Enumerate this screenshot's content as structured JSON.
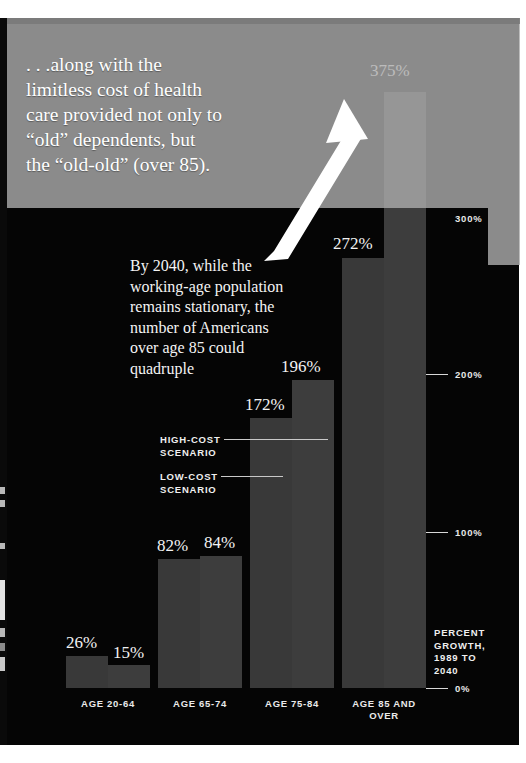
{
  "caption": {
    "text": ". . .along with the\nlimitless cost of health\ncare provided not only to\n“old” dependents, but\nthe “old-old” (over 85)."
  },
  "annotation": {
    "text": "By 2040, while the\nworking-age population\nremains stationary, the\nnumber of Americans\nover age 85 could\nquadruple"
  },
  "legend": {
    "high": "HIGH-COST\nSCENARIO",
    "low": "LOW-COST\nSCENARIO"
  },
  "axis": {
    "caption": "PERCENT\nGROWTH,\n1989 TO\n2040",
    "ticks": [
      "300%",
      "200%",
      "100%",
      "0%"
    ]
  },
  "colors": {
    "plate": "#050505",
    "bar": "#3b3b3b",
    "overlay": "#adadad",
    "text": "#f2f2f2"
  },
  "chart_data": {
    "type": "bar",
    "title": ". . .along with the limitless cost of health care provided not only to “old” dependents, but the “old-old” (over 85).",
    "xlabel": "",
    "ylabel": "PERCENT GROWTH, 1989 TO 2040",
    "ylim": [
      0,
      400
    ],
    "yticks": [
      0,
      100,
      200,
      300
    ],
    "ytick_labels": [
      "0%",
      "100%",
      "200%",
      "300%"
    ],
    "grid": false,
    "legend_position": "inside-left",
    "categories": [
      "AGE 20-64",
      "AGE 65-74",
      "AGE 75-84",
      "AGE 85 AND OVER"
    ],
    "series": [
      {
        "name": "LOW-COST SCENARIO",
        "values": [
          26,
          82,
          172,
          272
        ],
        "labels": [
          "26%",
          "82%",
          "172%",
          "272%"
        ]
      },
      {
        "name": "HIGH-COST SCENARIO",
        "values": [
          15,
          84,
          196,
          375
        ],
        "labels": [
          "15%",
          "84%",
          "196%",
          "375%"
        ]
      }
    ],
    "annotations": [
      "By 2040, while the working-age population remains stationary, the number of Americans over age 85 could quadruple"
    ]
  },
  "bars": [
    {
      "name": "age-20-64-low",
      "label": "26%",
      "x": 66,
      "y": 656,
      "w": 42,
      "h": 32,
      "cls": "lo"
    },
    {
      "name": "age-20-64-high",
      "label": "15%",
      "x": 108,
      "y": 665,
      "w": 42,
      "h": 23,
      "cls": "hi"
    },
    {
      "name": "age-65-74-low",
      "label": "82%",
      "x": 158,
      "y": 559,
      "w": 42,
      "h": 129,
      "cls": "lo"
    },
    {
      "name": "age-65-74-high",
      "label": "84%",
      "x": 200,
      "y": 556,
      "w": 42,
      "h": 132,
      "cls": "hi"
    },
    {
      "name": "age-75-84-low",
      "label": "172%",
      "x": 250,
      "y": 418,
      "w": 42,
      "h": 270,
      "cls": "lo"
    },
    {
      "name": "age-75-84-high",
      "label": "196%",
      "x": 292,
      "y": 380,
      "w": 42,
      "h": 308,
      "cls": "hi"
    },
    {
      "name": "age-85-over-low",
      "label": "272%",
      "x": 342,
      "y": 258,
      "w": 42,
      "h": 430,
      "cls": "lo"
    },
    {
      "name": "age-85-over-high",
      "label": "375%",
      "x": 384,
      "y": 92,
      "w": 42,
      "h": 596,
      "cls": "hi"
    }
  ],
  "value_labels": [
    {
      "name": "value-26",
      "text": "26%",
      "x": 66,
      "y": 634
    },
    {
      "name": "value-15",
      "text": "15%",
      "x": 113,
      "y": 644
    },
    {
      "name": "value-82",
      "text": "82%",
      "x": 157,
      "y": 537
    },
    {
      "name": "value-84",
      "text": "84%",
      "x": 204,
      "y": 534
    },
    {
      "name": "value-172",
      "text": "172%",
      "x": 245,
      "y": 396
    },
    {
      "name": "value-196",
      "text": "196%",
      "x": 281,
      "y": 358
    },
    {
      "name": "value-272",
      "text": "272%",
      "x": 333,
      "y": 235
    },
    {
      "name": "value-375",
      "text": "375%",
      "x": 370,
      "y": 62
    }
  ],
  "categories_layout": [
    {
      "name": "cat-age-20-64",
      "text": "AGE 20-64",
      "x": 58,
      "y": 698,
      "w": 100
    },
    {
      "name": "cat-age-65-74",
      "text": "AGE 65-74",
      "x": 150,
      "y": 698,
      "w": 100
    },
    {
      "name": "cat-age-75-84",
      "text": "AGE 75-84",
      "x": 242,
      "y": 698,
      "w": 100
    },
    {
      "name": "cat-age-85-over",
      "text": "AGE 85 AND\nOVER",
      "x": 334,
      "y": 698,
      "w": 100
    }
  ],
  "axis_ticks_layout": [
    {
      "name": "axis-tick-300",
      "text": "300%",
      "y": 213,
      "line": false
    },
    {
      "name": "axis-tick-200",
      "text": "200%",
      "y": 369,
      "line": true
    },
    {
      "name": "axis-tick-100",
      "text": "100%",
      "y": 527,
      "line": true
    },
    {
      "name": "axis-tick-0",
      "text": "0%",
      "y": 683,
      "line": true
    }
  ]
}
